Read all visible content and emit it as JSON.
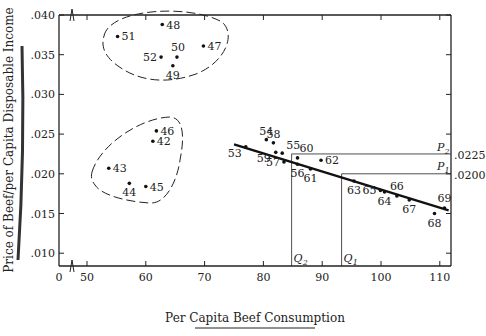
{
  "chart_data": {
    "type": "scatter",
    "title": "",
    "xlabel": "Per Capita Beef Consumption",
    "ylabel": "Price of Beef/per Capita Disposable Income",
    "xlim": [
      0,
      112
    ],
    "ylim": [
      0.005,
      0.04
    ],
    "x_axis_break": true,
    "x_ticks": [
      "0",
      "50",
      "60",
      "70",
      "80",
      "90",
      "100",
      "110"
    ],
    "y_ticks": [
      ".010",
      ".015",
      ".020",
      ".025",
      ".030",
      ".035",
      ".040"
    ],
    "grid": false,
    "points": [
      {
        "label": "42",
        "x": 61.2,
        "y": 0.0241
      },
      {
        "label": "43",
        "x": 53.7,
        "y": 0.0207
      },
      {
        "label": "44",
        "x": 57.2,
        "y": 0.0188
      },
      {
        "label": "45",
        "x": 60.0,
        "y": 0.0184
      },
      {
        "label": "46",
        "x": 61.8,
        "y": 0.0254
      },
      {
        "label": "47",
        "x": 69.8,
        "y": 0.0361
      },
      {
        "label": "48",
        "x": 62.8,
        "y": 0.0388
      },
      {
        "label": "49",
        "x": 64.6,
        "y": 0.0336
      },
      {
        "label": "50",
        "x": 65.3,
        "y": 0.0347
      },
      {
        "label": "51",
        "x": 55.2,
        "y": 0.0373
      },
      {
        "label": "52",
        "x": 62.6,
        "y": 0.0347
      },
      {
        "label": "53",
        "x": 77.0,
        "y": 0.0234
      },
      {
        "label": "54",
        "x": 80.5,
        "y": 0.0243
      },
      {
        "label": "55",
        "x": 83.2,
        "y": 0.0226
      },
      {
        "label": "56",
        "x": 85.8,
        "y": 0.0212
      },
      {
        "label": "57",
        "x": 83.5,
        "y": 0.0215
      },
      {
        "label": "58",
        "x": 81.7,
        "y": 0.0239
      },
      {
        "label": "59",
        "x": 82.1,
        "y": 0.0227
      },
      {
        "label": "60",
        "x": 85.8,
        "y": 0.022
      },
      {
        "label": "61",
        "x": 88.0,
        "y": 0.0206
      },
      {
        "label": "62",
        "x": 89.8,
        "y": 0.0217
      },
      {
        "label": "63",
        "x": 95.4,
        "y": 0.0191
      },
      {
        "label": "64",
        "x": 100.6,
        "y": 0.0177
      },
      {
        "label": "65",
        "x": 99.9,
        "y": 0.0179
      },
      {
        "label": "66",
        "x": 102.7,
        "y": 0.0172
      },
      {
        "label": "67",
        "x": 104.8,
        "y": 0.0167
      },
      {
        "label": "68",
        "x": 109.1,
        "y": 0.015
      },
      {
        "label": "69",
        "x": 110.8,
        "y": 0.0157
      }
    ],
    "regression_line": {
      "x1": 75.0,
      "y1": 0.0237,
      "x2": 111.5,
      "y2": 0.0154
    },
    "clusters": [
      {
        "name": "upper-cluster",
        "members": [
          "47",
          "48",
          "49",
          "50",
          "51",
          "52"
        ],
        "style": "dashed-ellipse"
      },
      {
        "name": "lower-cluster",
        "members": [
          "42",
          "43",
          "44",
          "45",
          "46"
        ],
        "style": "dashed-ellipse"
      }
    ],
    "annotations": {
      "P1": {
        "label": "P",
        "sub": "1",
        "value": ".0200",
        "y": 0.02,
        "x_at_line": 93.3
      },
      "P2": {
        "label": "P",
        "sub": "2",
        "value": ".0225",
        "y": 0.0225,
        "x_at_line": 84.8
      },
      "Q1": {
        "label": "Q",
        "sub": "1",
        "x": 93.3
      },
      "Q2": {
        "label": "Q",
        "sub": "2",
        "x": 84.8
      }
    }
  },
  "colors": {
    "ink": "#222222",
    "background": "#ffffff"
  }
}
